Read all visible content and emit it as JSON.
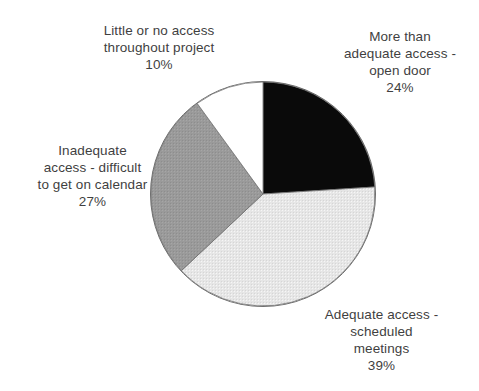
{
  "chart_data": {
    "type": "pie",
    "title": "",
    "categories": [
      "More than adequate access - open door",
      "Adequate access - scheduled meetings",
      "Inadequate access - difficult to get on calendar",
      "Little or no access throughout project"
    ],
    "values": [
      24,
      39,
      27,
      10
    ],
    "value_unit": "%",
    "start_angle_deg": 0,
    "direction": "clockwise",
    "legend": "none",
    "grid": false,
    "slices": [
      {
        "key": "more_than_adequate",
        "label_lines": "More than\nadequate access -\nopen door",
        "value_text": "24%",
        "value": 24,
        "fill": "#0a0a0a",
        "pattern": "solid",
        "start_deg": 0,
        "end_deg": 86.4
      },
      {
        "key": "adequate",
        "label_lines": "Adequate access -\nscheduled\nmeetings",
        "value_text": "39%",
        "value": 39,
        "fill": "#e3e3e3",
        "pattern": "fine-crosshatch",
        "start_deg": 86.4,
        "end_deg": 226.8
      },
      {
        "key": "inadequate",
        "label_lines": "Inadequate\naccess - difficult\nto get on calendar",
        "value_text": "27%",
        "value": 27,
        "fill": "#969696",
        "pattern": "fine-crosshatch",
        "start_deg": 226.8,
        "end_deg": 324.0
      },
      {
        "key": "little_or_none",
        "label_lines": "Little or no access\nthroughout project",
        "value_text": "10%",
        "value": 10,
        "fill": "#ffffff",
        "pattern": "solid",
        "start_deg": 324.0,
        "end_deg": 360.0
      }
    ],
    "geometry": {
      "center_x": 263,
      "center_y": 194,
      "radius": 112,
      "outline_color": "#6e6e6e"
    }
  },
  "labels": {
    "little_or_no_access": "Little or no access\nthroughout project\n10%",
    "more_than_adequate": "More than\nadequate access -\nopen door\n24%",
    "inadequate_access": "Inadequate\naccess - difficult\nto get on calendar\n27%",
    "adequate_access": "Adequate access -\nscheduled\nmeetings\n39%"
  },
  "colors": {
    "background": "#ffffff",
    "text": "#3f3f3f",
    "slice_black": "#0a0a0a",
    "slice_light_gray": "#e3e3e3",
    "slice_medium_gray": "#969696",
    "slice_white": "#ffffff",
    "outline": "#6e6e6e"
  }
}
